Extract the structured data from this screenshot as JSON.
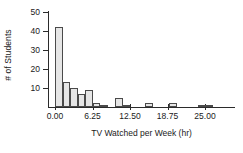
{
  "chart_data": {
    "type": "bar",
    "title": "",
    "subtitle": "",
    "xlabel": "TV Watched per Week (hr)",
    "ylabel": "# of Students",
    "xlim": [
      -0.9,
      30.0
    ],
    "ylim": [
      0,
      52
    ],
    "grid": false,
    "legend": null,
    "bin_width": 1.25,
    "xticks": [
      0.0,
      6.25,
      12.5,
      18.75,
      25.0
    ],
    "xticklabels": [
      "0.00",
      "6.25",
      "12.50",
      "18.75",
      "25.00"
    ],
    "yticks": [
      10,
      20,
      30,
      40,
      50
    ],
    "yticklabels": [
      "10",
      "20",
      "30",
      "40",
      "50"
    ],
    "bar_fill": "#e6e6e6",
    "bar_edge": "#4a4a4a",
    "axis_color": "#2b2b2b",
    "text_color": "#1a1a1a",
    "bins": [
      {
        "x0": 0.0,
        "x1": 1.25,
        "value": 42
      },
      {
        "x0": 1.25,
        "x1": 2.5,
        "value": 13
      },
      {
        "x0": 2.5,
        "x1": 3.75,
        "value": 10
      },
      {
        "x0": 3.75,
        "x1": 5.0,
        "value": 7
      },
      {
        "x0": 5.0,
        "x1": 6.25,
        "value": 9
      },
      {
        "x0": 6.25,
        "x1": 7.5,
        "value": 2
      },
      {
        "x0": 7.5,
        "x1": 8.75,
        "value": 1
      },
      {
        "x0": 10.0,
        "x1": 11.25,
        "value": 5
      },
      {
        "x0": 11.25,
        "x1": 12.5,
        "value": 1
      },
      {
        "x0": 15.0,
        "x1": 16.25,
        "value": 2
      },
      {
        "x0": 19.0,
        "x1": 20.25,
        "value": 2
      },
      {
        "x0": 23.75,
        "x1": 25.0,
        "value": 1
      },
      {
        "x0": 25.0,
        "x1": 26.25,
        "value": 1
      }
    ]
  }
}
